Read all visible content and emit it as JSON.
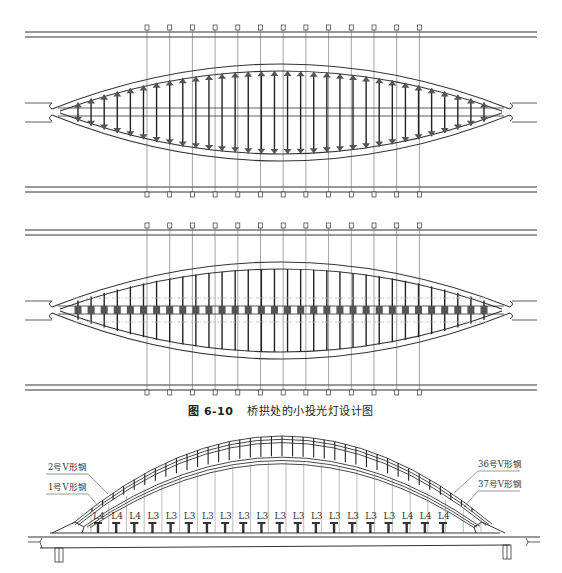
{
  "caption": {
    "number": "图 6-10",
    "title": "桥拱处的小投光灯设计图"
  },
  "figures": [
    {
      "name": "plan-view-upward-lights",
      "description": "桥拱平面图 — 拱肋两侧投光灯布置"
    },
    {
      "name": "plan-view-center-lights",
      "description": "桥拱平面图 — 中线投光灯布置"
    },
    {
      "name": "elevation-view",
      "description": "桥拱立面图"
    }
  ],
  "elevation": {
    "callouts_left": [
      "2号V形钢",
      "1号V形钢"
    ],
    "callouts_right": [
      "36号V形钢",
      "37号V形钢"
    ],
    "lamp_labels": [
      "L4",
      "L4",
      "L4",
      "L3",
      "L3",
      "L3",
      "L3",
      "L3",
      "L3",
      "L3",
      "L3",
      "L3",
      "L3",
      "L3",
      "L3",
      "L3",
      "L3",
      "L4",
      "L4",
      "L4"
    ]
  },
  "plan": {
    "lamp_post_count": 13,
    "hanger_count": 32
  },
  "colors": {
    "line": "#333333",
    "light_fill": "#555555",
    "background": "#ffffff"
  }
}
